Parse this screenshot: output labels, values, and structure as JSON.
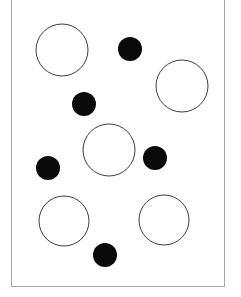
{
  "panel": {
    "name": "circle-stimulus-panel",
    "background_color": "#ffffff",
    "border_color": "#a8a8a8",
    "border_width_px": 1,
    "x": 11,
    "y": -6,
    "width": 214,
    "height": 293
  },
  "legend": {
    "open_circle_label": "large open circle",
    "filled_circle_label": "small filled circle",
    "open_circle_fill": "#ffffff",
    "open_circle_stroke": "#3d3d3d",
    "filled_circle_fill": "#0a0a0a"
  },
  "counts": {
    "open_circles": 5,
    "filled_circles": 6,
    "total_shapes": 11
  },
  "chart_data": {
    "type": "scatter",
    "title": "",
    "xlabel": "",
    "ylabel": "",
    "xlim": [
      0,
      241
    ],
    "ylim": [
      0,
      297
    ],
    "grid": false,
    "legend_position": "none",
    "series": [
      {
        "name": "large open circle",
        "marker": "open-circle",
        "fill": "#ffffff",
        "stroke": "#3d3d3d",
        "stroke_width": 1,
        "points": [
          {
            "id": "open-1",
            "label": "top-left open circle",
            "cx": 62,
            "cy": 50,
            "r": 26
          },
          {
            "id": "open-2",
            "label": "top-right open circle",
            "cx": 182,
            "cy": 86,
            "r": 26
          },
          {
            "id": "open-3",
            "label": "center open circle",
            "cx": 109,
            "cy": 150,
            "r": 26
          },
          {
            "id": "open-4",
            "label": "bottom-left open circle",
            "cx": 64,
            "cy": 221,
            "r": 25
          },
          {
            "id": "open-5",
            "label": "bottom-right open circle",
            "cx": 164,
            "cy": 220,
            "r": 25
          }
        ]
      },
      {
        "name": "small filled circle",
        "marker": "filled-circle",
        "fill": "#0a0a0a",
        "stroke": "none",
        "stroke_width": 0,
        "points": [
          {
            "id": "dot-1",
            "label": "upper dot",
            "cx": 130,
            "cy": 49,
            "r": 12
          },
          {
            "id": "dot-2",
            "label": "upper-left dot",
            "cx": 84,
            "cy": 104,
            "r": 12
          },
          {
            "id": "dot-3",
            "label": "mid-left dot",
            "cx": 48,
            "cy": 168,
            "r": 12
          },
          {
            "id": "dot-4",
            "label": "mid-right dot",
            "cx": 155,
            "cy": 158,
            "r": 12
          },
          {
            "id": "dot-5",
            "label": "bottom dot",
            "cx": 105,
            "cy": 255,
            "r": 12
          },
          {
            "id": "dot-6",
            "label": "right-upper dot",
            "cx": 130,
            "cy": 49,
            "r": 12
          }
        ]
      }
    ]
  }
}
